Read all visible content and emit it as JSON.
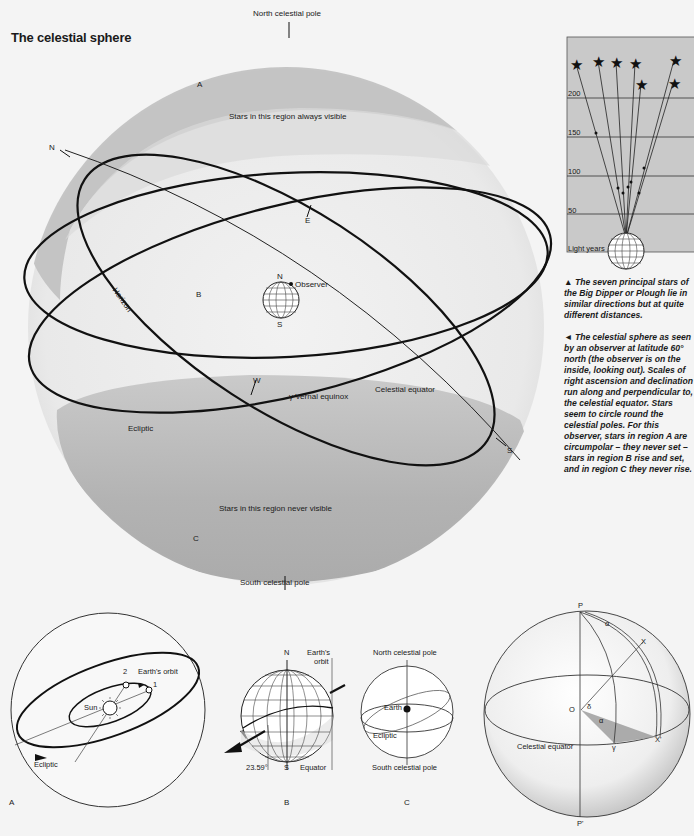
{
  "title": "The celestial sphere",
  "main_diagram": {
    "north_pole_label": "North celestial pole",
    "south_pole_label": "South celestial pole",
    "region_a": "A",
    "region_b": "B",
    "region_c": "C",
    "always_visible": "Stars in this region always visible",
    "never_visible": "Stars in this region never visible",
    "horizon_label": "Horizon",
    "compass_n": "N",
    "compass_e": "E",
    "compass_w": "W",
    "compass_s": "S",
    "observer_label": "Observer",
    "globe_n": "N",
    "globe_s": "S",
    "vernal_equinox": "γ Vernal equinox",
    "celestial_equator": "Celestial equator",
    "ecliptic": "Ecliptic",
    "colors": {
      "region_shade": "#b8b8b8",
      "sphere_light": "#e6e6e6",
      "line": "#111111"
    }
  },
  "big_dipper": {
    "y_ticks": [
      "200",
      "150",
      "100",
      "50"
    ],
    "unit_label": "Light years",
    "chart_bg": "#c9c9c9"
  },
  "captions": {
    "big_dipper": "▲ The seven principal stars of the Big Dipper or Plough lie in similar directions but at quite different distances.",
    "celestial_sphere": "◄ The celestial sphere as seen by an observer at latitude 60° north (the observer is on the inside, looking out). Scales of right ascension and declination run along and perpendicular to, the celestial equator. Stars seem to circle round the celestial poles. For this observer, stars in region A are circumpolar – they never set – stars in region B rise and set, and in region C they never rise."
  },
  "panel_a": {
    "letter": "A",
    "sun": "Sun",
    "earths_orbit": "Earth's orbit",
    "pos1": "1",
    "pos2": "2",
    "ecliptic": "Ecliptic"
  },
  "panel_b": {
    "letter": "B",
    "n": "N",
    "s": "S",
    "earths_orbit_line1": "Earth's",
    "earths_orbit_line2": "orbit",
    "tilt": "23.59°",
    "equator": "Equator"
  },
  "panel_c": {
    "letter": "C",
    "north": "North celestial pole",
    "south": "South celestial pole",
    "earth": "Earth",
    "ecliptic": "Ecliptic"
  },
  "panel_d": {
    "p": "P",
    "p_prime": "P'",
    "o": "O",
    "x": "X",
    "x_prime": "X'",
    "alpha": "α",
    "delta": "δ",
    "gamma": "γ",
    "celestial_equator": "Celestial equator"
  }
}
